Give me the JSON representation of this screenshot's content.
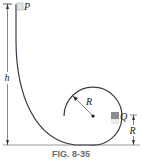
{
  "figure": {
    "caption": "FIG. 8-35",
    "labels": {
      "block_top": "P",
      "height": "h",
      "loop_radius": "R",
      "block_side": "Q",
      "side_height": "R"
    },
    "colors": {
      "track": "#3a3a4a",
      "block": "#8c8c8c",
      "dimension": "#333333",
      "ground": "#9a9a9a",
      "caption": "#6a6a6a"
    }
  }
}
